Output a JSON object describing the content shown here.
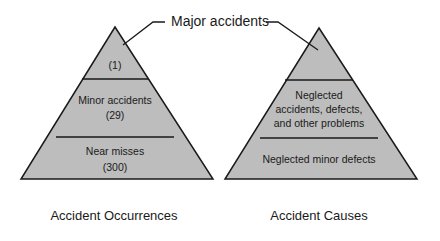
{
  "callout": {
    "label": "Major accidents"
  },
  "colors": {
    "fill": "#bdbdbd",
    "stroke": "#1a1a1a",
    "background": "#ffffff"
  },
  "left_pyramid": {
    "caption": "Accident Occurrences",
    "tiers": [
      {
        "lines": [
          "(1)"
        ]
      },
      {
        "lines": [
          "Minor accidents",
          "(29)"
        ]
      },
      {
        "lines": [
          "Near misses",
          "(300)"
        ]
      }
    ]
  },
  "right_pyramid": {
    "caption": "Accident Causes",
    "tiers": [
      {
        "lines": []
      },
      {
        "lines": [
          "Neglected",
          "accidents, defects,",
          "and other problems"
        ]
      },
      {
        "lines": [
          "Neglected minor defects"
        ]
      }
    ]
  }
}
